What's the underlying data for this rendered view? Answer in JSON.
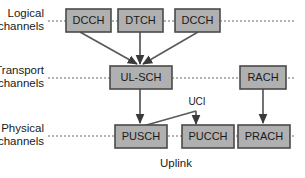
{
  "diagram": {
    "title": "Uplink",
    "footer_label": "Uplink",
    "row_labels": [
      {
        "line1": "Logical",
        "line2": "channels"
      },
      {
        "line1": "Transport",
        "line2": "channels"
      },
      {
        "line1": "Physical",
        "line2": "channels"
      }
    ],
    "annotations": [
      {
        "id": "uci",
        "text": "UCI"
      }
    ],
    "colors": {
      "box_fill": "#b0b0b0",
      "box_stroke": "#4a4a4a",
      "guide_line": "#9a9a9a",
      "flow_line": "#5a5a5a",
      "text": "#1a1a1a",
      "background": "#ffffff"
    },
    "nodes": {
      "logical": [
        {
          "id": "dcch1",
          "label": "DCCH"
        },
        {
          "id": "dtch",
          "label": "DTCH"
        },
        {
          "id": "dcch2",
          "label": "DCCH"
        }
      ],
      "transport": [
        {
          "id": "ulsch",
          "label": "UL-SCH"
        },
        {
          "id": "rach",
          "label": "RACH"
        }
      ],
      "physical": [
        {
          "id": "pusch",
          "label": "PUSCH"
        },
        {
          "id": "pucch",
          "label": "PUCCH"
        },
        {
          "id": "prach",
          "label": "PRACH"
        }
      ]
    },
    "connections": [
      {
        "from": "dcch1",
        "to": "ulsch"
      },
      {
        "from": "dtch",
        "to": "ulsch"
      },
      {
        "from": "dcch2",
        "to": "ulsch"
      },
      {
        "from": "ulsch",
        "to": "pusch"
      },
      {
        "from": "rach",
        "to": "prach"
      },
      {
        "from": "pusch",
        "to": "pucch",
        "label": "UCI"
      }
    ]
  }
}
